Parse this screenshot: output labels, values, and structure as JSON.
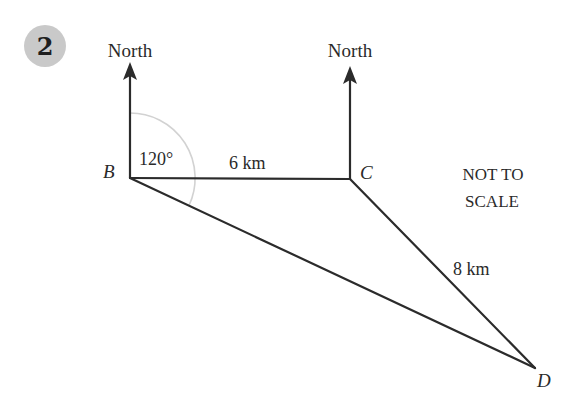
{
  "question": {
    "number": "2",
    "badge_color": "#c9c9c9"
  },
  "diagram": {
    "note_line1": "NOT TO",
    "note_line2": "SCALE",
    "points": {
      "B": "B",
      "C": "C",
      "D": "D"
    },
    "north_labels": {
      "at_B": "North",
      "at_C": "North"
    },
    "angle_label": "120°",
    "lengths": {
      "BC": "6 km",
      "CD": "8 km"
    },
    "line_color": "#2b2b2b",
    "arc_color": "#d2d2d2"
  }
}
